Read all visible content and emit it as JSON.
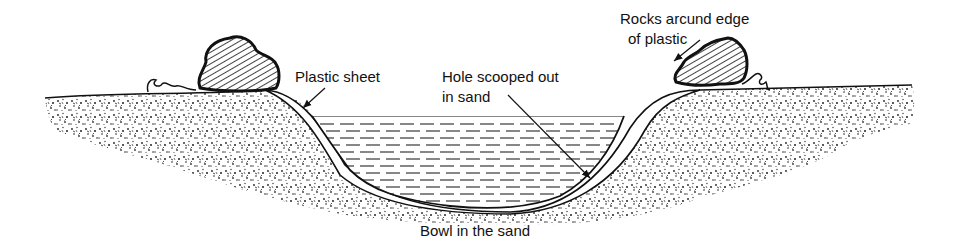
{
  "diagram": {
    "labels": {
      "rocks": "Rocks arcund edge",
      "rocks_line2": "of plastic",
      "plastic_sheet": "Plastic sheet",
      "hole": "Hole scooped out",
      "hole_line2": "in sand",
      "bowl": "Bowl in the sand"
    },
    "elements": [
      "sand-ground",
      "water-pool",
      "plastic-sheet",
      "rock-left",
      "rock-right",
      "plastic-edge-left",
      "plastic-edge-right"
    ],
    "colors": {
      "ink": "#111111",
      "background": "#ffffff",
      "sand_speckle": "#2a2a2a"
    }
  }
}
